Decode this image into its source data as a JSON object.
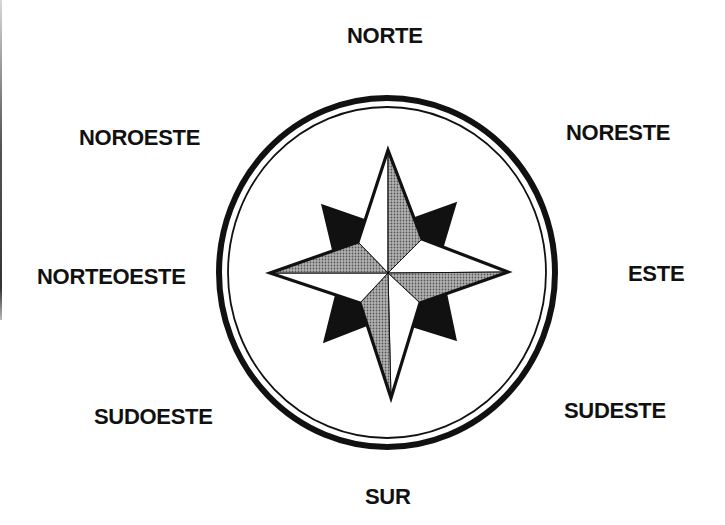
{
  "diagram": {
    "type": "compass-rose",
    "labels": {
      "n": "NORTE",
      "ne": "NORESTE",
      "e": "ESTE",
      "se": "SUDESTE",
      "s": "SUR",
      "sw": "SUDOESTE",
      "w": "NORTEOESTE",
      "nw": "NOROESTE"
    },
    "colors": {
      "ink": "#111111",
      "shade": "#8c8c8c",
      "paper": "#ffffff"
    }
  }
}
